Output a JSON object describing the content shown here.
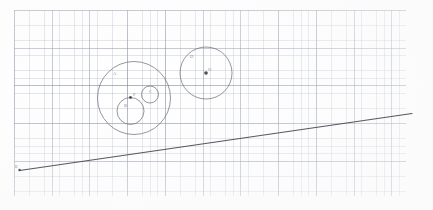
{
  "document": {
    "kind": "hand-drawn geometry sketch on graph paper",
    "title": "Circles and tangent line on graph paper",
    "background_color": "#ffffff",
    "ink_color": "#6e6e78",
    "line_ink_color": "#4a4a52",
    "grid_color": "#9ca6b4",
    "grid_major_color": "#848c9c"
  },
  "grid": {
    "origin_x": 14,
    "origin_y": 10,
    "width": 392,
    "height": 186,
    "fine_spacing_px": 7.55,
    "major_spacing_px": 37.75,
    "cells_per_major": 5
  },
  "chart_data": {
    "type": "scatter",
    "xlabel": "",
    "ylabel": "",
    "grid": true,
    "legend": "none",
    "xlim": [
      14,
      406
    ],
    "ylim": [
      10,
      196
    ],
    "circles": [
      {
        "name": "outer-large-circle",
        "cx": 134,
        "cy": 98,
        "r": 36.5,
        "label": "A",
        "label_x": 113,
        "label_y": 72,
        "stroke": "#6e6e78",
        "stroke_width": 0.8,
        "has_center_dot": false
      },
      {
        "name": "inner-lower-circle",
        "cx": 130.5,
        "cy": 111,
        "r": 13.5,
        "label": "B",
        "label_x": 124,
        "label_y": 104,
        "stroke": "#6e6e78",
        "stroke_width": 0.8,
        "has_center_dot": false
      },
      {
        "name": "inner-small-circle",
        "cx": 150,
        "cy": 94.5,
        "r": 8.5,
        "label": "C",
        "label_x": 149,
        "label_y": 90,
        "stroke": "#6e6e78",
        "stroke_width": 0.8,
        "has_center_dot": false
      },
      {
        "name": "right-circle",
        "cx": 206,
        "cy": 73,
        "r": 26,
        "label": "D",
        "label_x": 190,
        "label_y": 55,
        "stroke": "#6e6e78",
        "stroke_width": 0.8,
        "has_center_dot": true
      }
    ],
    "points": [
      {
        "name": "shared-tangency-point",
        "x": 130.5,
        "y": 97.5,
        "label": "P",
        "label_x": 133,
        "label_y": 93,
        "radius": 1.4,
        "color": "#3a3a42"
      },
      {
        "name": "right-circle-center-point",
        "x": 206,
        "y": 73,
        "label": "O",
        "label_x": 208,
        "label_y": 68,
        "radius": 1.8,
        "color": "#2e2e36"
      },
      {
        "name": "line-left-endpoint-mark",
        "x": 19.5,
        "y": 170,
        "label": "E",
        "label_x": 15,
        "label_y": 165,
        "radius": 1.2,
        "color": "#3a3a42"
      }
    ],
    "lines": [
      {
        "name": "tangent-line",
        "x1": 19.5,
        "y1": 170.5,
        "x2": 412,
        "y2": 113.5,
        "stroke": "#4a4a52",
        "stroke_width": 1.1,
        "slope": -0.145
      }
    ]
  }
}
